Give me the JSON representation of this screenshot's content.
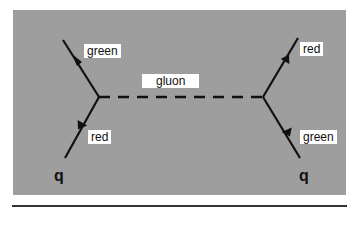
{
  "diagram": {
    "type": "feynman-diagram",
    "background_color": "#9e9e9e",
    "labels": {
      "left_top": "green",
      "left_bottom": "red",
      "right_top": "red",
      "right_bottom": "green",
      "propagator": "gluon",
      "left_quark": "q",
      "right_quark": "q"
    },
    "nodes": [
      {
        "id": "left-vertex",
        "x": 99,
        "y": 97
      },
      {
        "id": "right-vertex",
        "x": 263,
        "y": 97
      }
    ],
    "edges": [
      {
        "from": "left-quark-in",
        "to": "left-vertex",
        "label": "red",
        "style": "solid-arrow"
      },
      {
        "from": "left-vertex",
        "to": "left-quark-out",
        "label": "green",
        "style": "solid-arrow"
      },
      {
        "from": "right-quark-in",
        "to": "right-vertex",
        "label": "green",
        "style": "solid-arrow"
      },
      {
        "from": "right-vertex",
        "to": "right-quark-out",
        "label": "red",
        "style": "solid-arrow"
      },
      {
        "from": "left-vertex",
        "to": "right-vertex",
        "label": "gluon",
        "style": "dashed"
      }
    ]
  }
}
